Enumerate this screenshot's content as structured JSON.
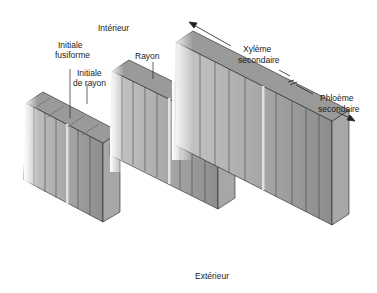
{
  "labels": {
    "interior": "Intérieur",
    "fusiform_initial_1": "Initiale",
    "fusiform_initial_2": "fusiforme",
    "ray_initial_1": "Initiale",
    "ray_initial_2": "de rayon",
    "ray": "Rayon",
    "xylem_1": "Xylème",
    "xylem_2": "secondaire",
    "phloem_1": "Phloème",
    "phloem_2": "secondaire",
    "exterior": "Extérieur"
  },
  "colors": {
    "face_front": "#8a8a8a",
    "face_side": "#b5b5b5",
    "face_top": "#9c9c9c",
    "ray_strip": "#d8d8d8",
    "line": "#222222"
  },
  "blocks": [
    {
      "name": "block-1-cambium",
      "stage": 1
    },
    {
      "name": "block-2-division",
      "stage": 2
    },
    {
      "name": "block-3-xylem-phloem",
      "stage": 3
    }
  ]
}
